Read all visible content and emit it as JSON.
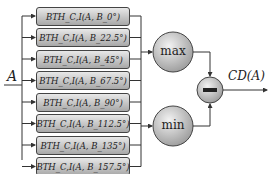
{
  "input_label": "A",
  "output_label": "CD(A)",
  "boxes": [
    {
      "label": "BTH_C,I(A, B_0°)",
      "func": "𝓑𝓣ℋ",
      "sub": "C,I",
      "angle": "0°"
    },
    {
      "label": "BTH_C,I(A, B_22.5°)",
      "func": "𝓑𝓣ℋ",
      "sub": "C,I",
      "angle": "22.5°"
    },
    {
      "label": "BTH_C,I(A, B_45°)",
      "func": "𝓑𝓣ℋ",
      "sub": "C,I",
      "angle": "45°"
    },
    {
      "label": "BTH_C,I(A, B_67.5°)",
      "func": "𝓑𝓣ℋ",
      "sub": "C,I",
      "angle": "67.5°"
    },
    {
      "label": "BTH_C,I(A, B_90°)",
      "func": "𝓑𝓣ℋ",
      "sub": "C,I",
      "angle": "90°"
    },
    {
      "label": "BTH_C,I(A, B_112.5°)",
      "func": "𝓑𝓣ℋ",
      "sub": "C,I",
      "angle": "112.5°"
    },
    {
      "label": "BTH_C,I(A, B_135°)",
      "func": "𝓑𝓣ℋ",
      "sub": "C,I",
      "angle": "135°"
    },
    {
      "label": "BTH_C,I(A, B_157.5°)",
      "func": "𝓑𝓣ℋ",
      "sub": "C,I",
      "angle": "157.5°"
    }
  ],
  "max_node": {
    "label": "max"
  },
  "min_node": {
    "label": "min"
  },
  "diff_node": {
    "label": "−"
  }
}
